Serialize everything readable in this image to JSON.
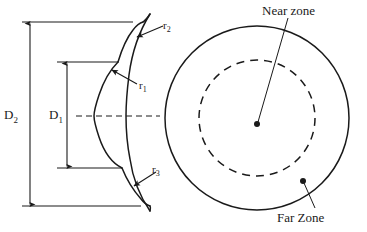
{
  "figure": {
    "background_color": "#ffffff",
    "line_color": "#1a1a1a"
  },
  "side_view": {
    "name": "cross-section profile",
    "dimensions": [
      {
        "id": "D2",
        "label": "D",
        "subscript": "2",
        "description": "outer diameter dimension arrow"
      },
      {
        "id": "D1",
        "label": "D",
        "subscript": "1",
        "description": "inner diameter dimension arrow"
      }
    ],
    "radii": [
      {
        "id": "r1",
        "label": "r",
        "subscript": "1",
        "description": "middle radius callout"
      },
      {
        "id": "r2",
        "label": "r",
        "subscript": "2",
        "description": "upper radius callout"
      },
      {
        "id": "r3",
        "label": "r",
        "subscript": "3",
        "description": "lower radius callout"
      }
    ],
    "centerline": "dashed horizontal axis"
  },
  "front_view": {
    "name": "concentric zone circles",
    "zones": [
      {
        "id": "near",
        "label": "Near zone",
        "boundary": "dashed inner circle"
      },
      {
        "id": "far",
        "label": "Far Zone",
        "boundary": "solid outer circle"
      }
    ]
  }
}
